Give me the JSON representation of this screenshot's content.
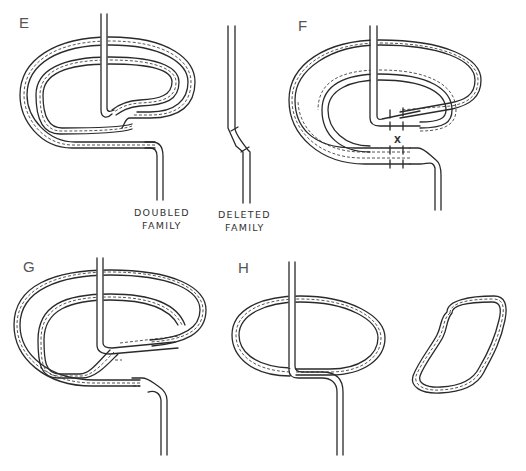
{
  "figure": {
    "panels": [
      {
        "id": "E",
        "label": "E"
      },
      {
        "id": "F",
        "label": "F",
        "marker": "X"
      },
      {
        "id": "G",
        "label": "G"
      },
      {
        "id": "H",
        "label": "H"
      }
    ],
    "captions": {
      "doubled_line1": "DOUBLED",
      "doubled_line2": "FAMILY",
      "deleted_line1": "DELETED",
      "deleted_line2": "FAMILY"
    }
  }
}
